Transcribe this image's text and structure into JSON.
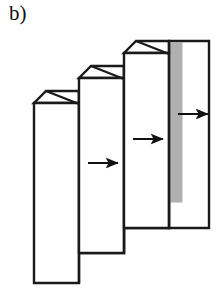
{
  "figure": {
    "label": "b)",
    "type": "schematic-diagram",
    "canvas": {
      "width": 223,
      "height": 302
    },
    "background_color": "#ffffff"
  },
  "style": {
    "stroke_color": "#1a1a1a",
    "stroke_width": 2.4,
    "face_fill": "#ffffff",
    "shaded_fill": "#b0b0b0",
    "arrow_color": "#111111",
    "arrow_stroke_width": 2.0
  },
  "units": [
    {
      "id": "unit-1",
      "order": 1,
      "front_face": {
        "x": 34,
        "y": 103,
        "width": 45,
        "height": 180
      },
      "fold_apex": {
        "x": 46,
        "y": 91
      },
      "shaded_band": {
        "x": 79,
        "y": 91,
        "width": 13,
        "height": 162
      },
      "back_face": {
        "x": 79,
        "y": 91,
        "width": 45,
        "height": 162
      }
    },
    {
      "id": "unit-2",
      "order": 2,
      "front_face": {
        "x": 79,
        "y": 78,
        "width": 45,
        "height": 175
      },
      "fold_apex": {
        "x": 91,
        "y": 66
      },
      "shaded_band": {
        "x": 124,
        "y": 66,
        "width": 13,
        "height": 162
      },
      "back_face": {
        "x": 124,
        "y": 66,
        "width": 45,
        "height": 162
      }
    },
    {
      "id": "unit-3",
      "order": 3,
      "front_face": {
        "x": 124,
        "y": 53,
        "width": 45,
        "height": 175
      },
      "fold_apex": {
        "x": 136,
        "y": 41
      },
      "shaded_band": {
        "x": 169,
        "y": 41,
        "width": 13,
        "height": 162
      },
      "back_face": {
        "x": 169,
        "y": 41,
        "width": 40,
        "height": 187
      }
    }
  ],
  "arrows": [
    {
      "id": "arrow-1",
      "order": 1,
      "x1": 88,
      "y1": 163,
      "x2": 120,
      "y2": 163,
      "direction": "right"
    },
    {
      "id": "arrow-2",
      "order": 2,
      "x1": 133,
      "y1": 139,
      "x2": 165,
      "y2": 139,
      "direction": "right"
    },
    {
      "id": "arrow-3",
      "order": 3,
      "x1": 178,
      "y1": 114,
      "x2": 210,
      "y2": 114,
      "direction": "right"
    }
  ]
}
